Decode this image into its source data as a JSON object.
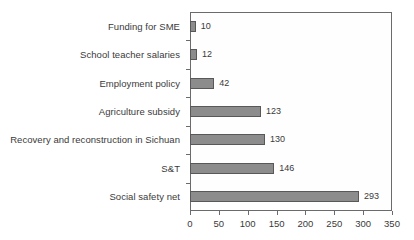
{
  "chart_data": {
    "type": "bar",
    "orientation": "horizontal",
    "title": "",
    "xlabel": "",
    "ylabel": "",
    "categories": [
      "Funding for SME",
      "School teacher salaries",
      "Employment policy",
      "Agriculture subsidy",
      "Recovery and reconstruction in Sichuan",
      "S&T",
      "Social safety net"
    ],
    "values": [
      10,
      12,
      42,
      123,
      130,
      146,
      293
    ],
    "value_labels": [
      "10",
      "12",
      "42",
      "123",
      "130",
      "146",
      "293"
    ],
    "xlim": [
      0,
      350
    ],
    "xticks": [
      0,
      50,
      100,
      150,
      200,
      250,
      300,
      350
    ],
    "xtick_labels": [
      "0",
      "50",
      "100",
      "150",
      "200",
      "250",
      "300",
      "350"
    ],
    "grid": false,
    "legend": null,
    "bar_color": "#8c8c8c",
    "bar_border_color": "#585858",
    "axis_color": "#6b6b6b",
    "text_color": "#3a3a3a",
    "background": "#ffffff"
  }
}
